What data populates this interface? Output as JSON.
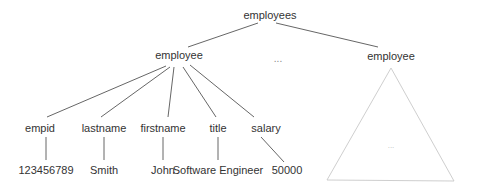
{
  "diagram": {
    "type": "tree",
    "root": {
      "label": "employees",
      "x": 270,
      "y": 19
    },
    "level1": [
      {
        "label": "employee",
        "x": 179,
        "y": 59,
        "expanded": true
      },
      {
        "label": "...",
        "x": 278,
        "y": 62,
        "is_ellipsis": true
      },
      {
        "label": "employee",
        "x": 391,
        "y": 60,
        "collapsed_subtree": true
      }
    ],
    "fields": [
      {
        "name": "empid",
        "value": "123456789",
        "name_x": 40,
        "value_x": 46,
        "value_line_x2": 46
      },
      {
        "name": "lastname",
        "value": "Smith",
        "name_x": 104,
        "value_x": 104,
        "value_line_x2": 104
      },
      {
        "name": "firstname",
        "value": "John",
        "name_x": 163,
        "value_x": 163,
        "value_line_x2": 163
      },
      {
        "name": "title",
        "value": "Software Engineer",
        "name_x": 218,
        "value_x": 218,
        "value_line_x2": 218
      },
      {
        "name": "salary",
        "value": "50000",
        "name_x": 266,
        "value_x": 287,
        "value_line_x2": 284
      }
    ],
    "collapsed_subtree_placeholder": "...",
    "colors": {
      "edge": "#555555",
      "text": "#333333",
      "subtree_outline": "#c8c8c8"
    }
  }
}
